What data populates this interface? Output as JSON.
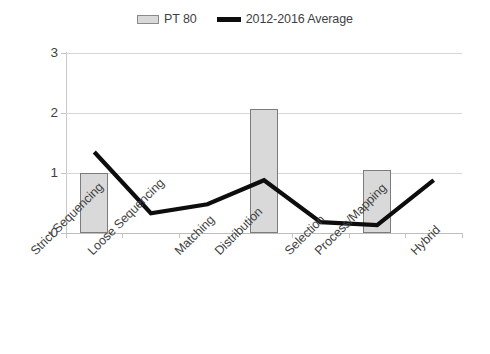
{
  "chart_data": {
    "type": "bar",
    "title": "",
    "subtitle": "",
    "xlabel": "",
    "ylabel": "",
    "ylim": [
      0,
      3
    ],
    "yticks": [
      0,
      1,
      2,
      3
    ],
    "ytick_labels": [
      "0",
      "1",
      "2",
      "3"
    ],
    "grid": true,
    "legend_position": "top-center",
    "categories": [
      "Strict Sequencing",
      "Loose Sequencing",
      "Matching",
      "Distribution",
      "Selection",
      "Process/Mapping",
      "Hybrid"
    ],
    "series": [
      {
        "name": "PT 80",
        "type": "bar",
        "color": "#d9d9d9",
        "edge_color": "#7c7c7c",
        "values": [
          1.0,
          0,
          0,
          2.07,
          0,
          1.05,
          0
        ]
      },
      {
        "name": "2012-2016 Average",
        "type": "line",
        "color": "#0d0d0d",
        "values": [
          1.35,
          0.33,
          0.48,
          0.88,
          0.18,
          0.13,
          0.88
        ]
      }
    ]
  },
  "legend": {
    "items": [
      {
        "label": "PT 80",
        "marker": "bar-swatch"
      },
      {
        "label": "2012-2016 Average",
        "marker": "line-swatch"
      }
    ]
  },
  "axes": {
    "y_tick_labels": [
      "3",
      "2",
      "1",
      "0"
    ],
    "x_tick_labels": [
      "Strict Sequencing",
      "Loose Sequencing",
      "Matching",
      "Distribution",
      "Selection",
      "Process/Mapping",
      "Hybrid"
    ]
  },
  "colors": {
    "bar_fill": "#d9d9d9",
    "bar_edge": "#7c7c7c",
    "line": "#0d0d0d",
    "grid": "#d6d6d6",
    "axis": "#c4c4c4",
    "text": "#3f3f3f",
    "background": "#ffffff"
  }
}
